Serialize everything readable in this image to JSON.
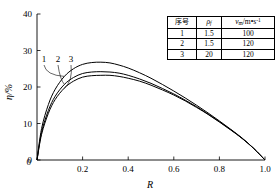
{
  "chart_data": {
    "type": "line",
    "title": "",
    "xlabel": "R",
    "ylabel": "η/%",
    "xlim": [
      0,
      1.0
    ],
    "ylim": [
      0,
      40
    ],
    "xticks": [
      "0",
      "0.2",
      "0.4",
      "0.6",
      "0.8",
      "1.0"
    ],
    "xtick_values": [
      0,
      0.2,
      0.4,
      0.6,
      0.8,
      1.0
    ],
    "yticks": [
      "0",
      "10",
      "20",
      "30",
      "40"
    ],
    "ytick_values": [
      0,
      10,
      20,
      30,
      40
    ],
    "grid": false,
    "legend_position": "inside-top-right",
    "series": [
      {
        "name": "1",
        "label": "1",
        "peak_x": 0.28,
        "peak_y": 26.8,
        "x": [
          0,
          0.02,
          0.05,
          0.08,
          0.12,
          0.16,
          0.2,
          0.24,
          0.28,
          0.32,
          0.36,
          0.4,
          0.45,
          0.5,
          0.55,
          0.6,
          0.65,
          0.7,
          0.75,
          0.8,
          0.85,
          0.9,
          0.95,
          1.0
        ],
        "y": [
          0,
          8.6,
          15.2,
          19.4,
          22.9,
          25.0,
          26.2,
          26.7,
          26.8,
          26.6,
          26.0,
          25.2,
          23.9,
          22.4,
          20.7,
          18.9,
          17.0,
          15.0,
          12.9,
          10.7,
          8.4,
          6.0,
          3.2,
          0
        ]
      },
      {
        "name": "2",
        "label": "2",
        "peak_x": 0.29,
        "peak_y": 24.2,
        "x": [
          0,
          0.02,
          0.05,
          0.08,
          0.12,
          0.16,
          0.2,
          0.24,
          0.28,
          0.32,
          0.36,
          0.4,
          0.45,
          0.5,
          0.55,
          0.6,
          0.65,
          0.7,
          0.75,
          0.8,
          0.85,
          0.9,
          0.95,
          1.0
        ],
        "y": [
          0,
          7.6,
          13.6,
          17.5,
          20.7,
          22.6,
          23.7,
          24.1,
          24.2,
          24.1,
          23.8,
          23.2,
          22.2,
          21.0,
          19.6,
          18.1,
          16.4,
          14.6,
          12.6,
          10.5,
          8.3,
          5.9,
          3.2,
          0
        ]
      },
      {
        "name": "3",
        "label": "3",
        "peak_x": 0.3,
        "peak_y": 23.2,
        "x": [
          0,
          0.02,
          0.05,
          0.08,
          0.12,
          0.16,
          0.2,
          0.24,
          0.28,
          0.32,
          0.36,
          0.4,
          0.45,
          0.5,
          0.55,
          0.6,
          0.65,
          0.7,
          0.75,
          0.8,
          0.85,
          0.9,
          0.95,
          1.0
        ],
        "y": [
          0,
          7.0,
          12.8,
          16.6,
          19.7,
          21.6,
          22.7,
          23.1,
          23.2,
          23.2,
          22.9,
          22.4,
          21.6,
          20.5,
          19.2,
          17.8,
          16.2,
          14.4,
          12.5,
          10.4,
          8.2,
          5.9,
          3.2,
          0
        ]
      }
    ],
    "curve_tags": [
      {
        "label": "1"
      },
      {
        "label": "2"
      },
      {
        "label": "3"
      }
    ],
    "legend_table": {
      "headers": [
        "序号",
        "ρ",
        "v"
      ],
      "header_sub": [
        "",
        "f",
        "m"
      ],
      "header_units": [
        "",
        "",
        "/m•s"
      ],
      "header_sup": [
        "",
        "",
        "-1"
      ],
      "rows": [
        {
          "index": "1",
          "rho": "1.5",
          "vm": "100"
        },
        {
          "index": "2",
          "rho": "1.5",
          "vm": "120"
        },
        {
          "index": "3",
          "rho": "20",
          "vm": "120"
        }
      ]
    }
  }
}
